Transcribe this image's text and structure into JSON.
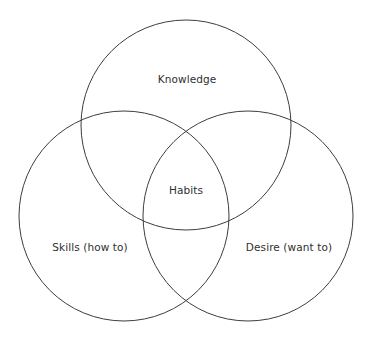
{
  "diagram": {
    "type": "venn",
    "stroke_color": "#3d3d3d",
    "text_color": "#2f2f2f",
    "circles": [
      {
        "id": "knowledge",
        "label": "Knowledge",
        "cx": 186,
        "cy": 125,
        "r": 105,
        "label_x": 187,
        "label_y": 79
      },
      {
        "id": "skills",
        "label": "Skills (how to)",
        "cx": 124,
        "cy": 216,
        "r": 105,
        "label_x": 90,
        "label_y": 247
      },
      {
        "id": "desire",
        "label": "Desire (want to)",
        "cx": 248,
        "cy": 216,
        "r": 105,
        "label_x": 289,
        "label_y": 247
      }
    ],
    "intersection": {
      "label": "Habits",
      "label_x": 186,
      "label_y": 190
    }
  }
}
